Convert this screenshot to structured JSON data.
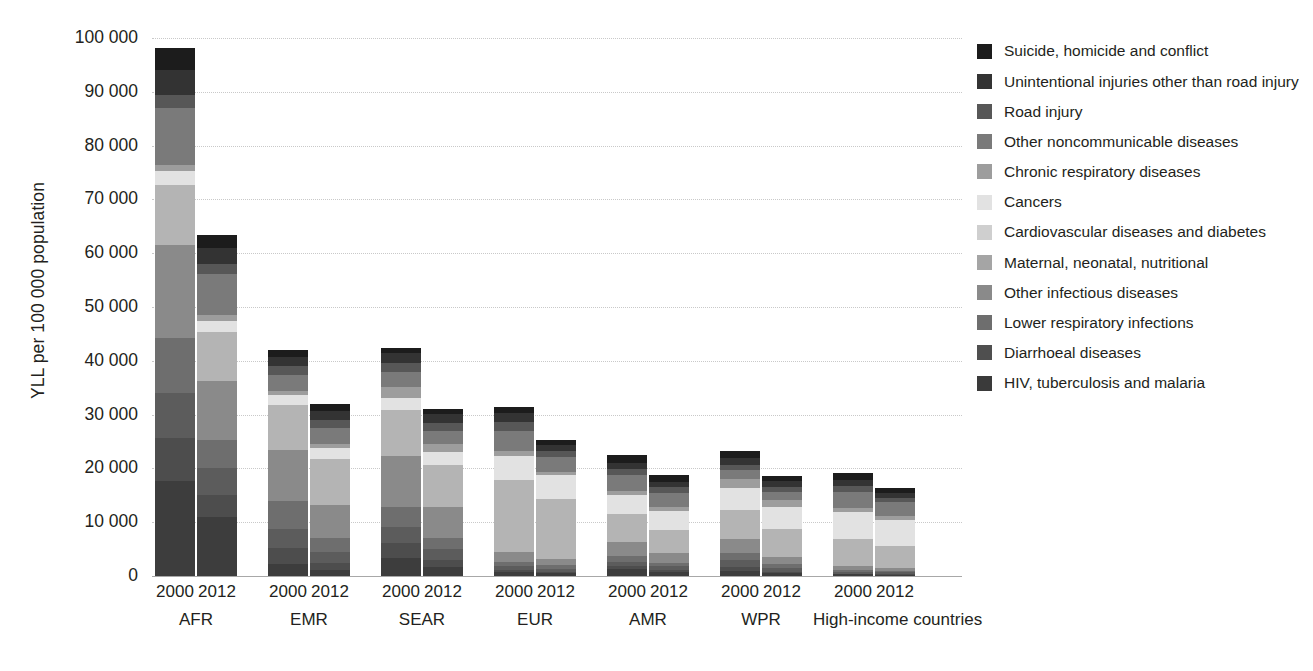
{
  "chart_data": {
    "type": "bar",
    "subtype": "stacked-bar-grouped",
    "title": "",
    "subtitle": "",
    "xlabel": "",
    "ylabel": "YLL per 100 000 population",
    "ylim": [
      0,
      100000
    ],
    "yticks": [
      0,
      10000,
      20000,
      30000,
      40000,
      50000,
      60000,
      70000,
      80000,
      90000,
      100000
    ],
    "ytick_labels": [
      "0",
      "10 000",
      "20 000",
      "30 000",
      "40 000",
      "50 000",
      "60 000",
      "70 000",
      "80 000",
      "90 000",
      "100 000"
    ],
    "grid": true,
    "legend_position": "right",
    "groups": [
      "AFR",
      "EMR",
      "SEAR",
      "EUR",
      "AMR",
      "WPR",
      "High-income countries"
    ],
    "years": [
      "2000",
      "2012"
    ],
    "categories": [
      "AFR 2000",
      "AFR 2012",
      "EMR 2000",
      "EMR 2012",
      "SEAR 2000",
      "SEAR 2012",
      "EUR 2000",
      "EUR 2012",
      "AMR 2000",
      "AMR 2012",
      "WPR 2000",
      "WPR 2012",
      "High-income countries 2000",
      "High-income countries 2012"
    ],
    "series": [
      {
        "name": "HIV, tuberculosis and malaria",
        "color": "#3d3d3d",
        "values": [
          17600,
          10900,
          2300,
          1200,
          3300,
          1700,
          800,
          500,
          1300,
          800,
          900,
          500,
          300,
          200
        ]
      },
      {
        "name": "Diarrhoeal diseases",
        "color": "#4d4d4d",
        "values": [
          8100,
          4200,
          3000,
          1300,
          2900,
          1300,
          300,
          200,
          500,
          300,
          800,
          300,
          100,
          100
        ]
      },
      {
        "name": "Lower respiratory infections",
        "color": "#5c5c5c",
        "values": [
          8300,
          4900,
          3400,
          1900,
          3000,
          2000,
          700,
          600,
          900,
          700,
          1300,
          700,
          400,
          400
        ]
      },
      {
        "name": "Other infectious diseases",
        "color": "#6e6e6e",
        "values": [
          10300,
          5200,
          5200,
          2600,
          3700,
          2000,
          900,
          700,
          1000,
          700,
          1200,
          700,
          300,
          300
        ]
      },
      {
        "name": "Maternal, neonatal, nutritional",
        "color": "#8a8a8a",
        "values": [
          17200,
          11000,
          9500,
          6200,
          9500,
          5800,
          1700,
          1100,
          2600,
          1700,
          2700,
          1300,
          700,
          500
        ]
      },
      {
        "name": "Cardiovascular diseases and diabetes",
        "color": "#b4b4b4",
        "values": [
          11200,
          9100,
          8400,
          8500,
          8500,
          7900,
          13500,
          11300,
          5200,
          4400,
          5400,
          5200,
          5000,
          4000
        ]
      },
      {
        "name": "Cancers",
        "color": "#e2e2e2",
        "values": [
          2500,
          2100,
          1900,
          2100,
          2200,
          2300,
          4400,
          4300,
          3500,
          3400,
          4000,
          4100,
          5100,
          5000
        ]
      },
      {
        "name": "Chronic respiratory diseases",
        "color": "#9d9d9d",
        "values": [
          1300,
          1100,
          700,
          700,
          2000,
          1600,
          900,
          700,
          900,
          800,
          1700,
          1300,
          800,
          600
        ]
      },
      {
        "name": "Other noncommunicable diseases",
        "color": "#7a7a7a",
        "values": [
          10500,
          7600,
          3000,
          3000,
          2900,
          2400,
          3800,
          2700,
          2800,
          2600,
          1700,
          1500,
          3000,
          2700
        ]
      },
      {
        "name": "Road injury",
        "color": "#575757",
        "values": [
          2400,
          1900,
          1600,
          1600,
          1600,
          1400,
          1600,
          1100,
          1200,
          1100,
          1000,
          900,
          1000,
          700
        ]
      },
      {
        "name": "Unintentional injuries other than road injury",
        "color": "#333333",
        "values": [
          4700,
          3000,
          1800,
          1600,
          1800,
          1700,
          1700,
          1100,
          1200,
          900,
          1300,
          1100,
          1200,
          900
        ]
      },
      {
        "name": "Suicide, homicide and conflict",
        "color": "#1c1c1c",
        "values": [
          4100,
          2400,
          1300,
          1200,
          1000,
          1000,
          1200,
          1000,
          1400,
          1300,
          1200,
          1000,
          1200,
          900
        ]
      }
    ],
    "totals": [
      98200,
      63400,
      42100,
      31900,
      42400,
      31100,
      31500,
      26300,
      22500,
      18700,
      23200,
      18600,
      19100,
      16300
    ]
  },
  "legend": {
    "items": [
      {
        "label": "Suicide, homicide and conflict",
        "color": "#1c1c1c"
      },
      {
        "label": "Unintentional injuries other than road injury",
        "color": "#333333"
      },
      {
        "label": "Road injury",
        "color": "#575757"
      },
      {
        "label": "Other noncommunicable diseases",
        "color": "#7a7a7a"
      },
      {
        "label": "Chronic respiratory diseases",
        "color": "#9d9d9d"
      },
      {
        "label": "Cancers",
        "color": "#e2e2e2"
      },
      {
        "label": "Cardiovascular diseases and diabetes",
        "color": "#cfcfcf"
      },
      {
        "label": "Maternal, neonatal, nutritional",
        "color": "#a5a5a5"
      },
      {
        "label": "Other infectious diseases",
        "color": "#8a8a8a"
      },
      {
        "label": "Lower respiratory infections",
        "color": "#6e6e6e"
      },
      {
        "label": "Diarrhoeal diseases",
        "color": "#4f4f4f"
      },
      {
        "label": "HIV, tuberculosis and malaria",
        "color": "#3a3a3a"
      }
    ]
  },
  "axis": {
    "y_title": "YLL per 100 000 population"
  }
}
